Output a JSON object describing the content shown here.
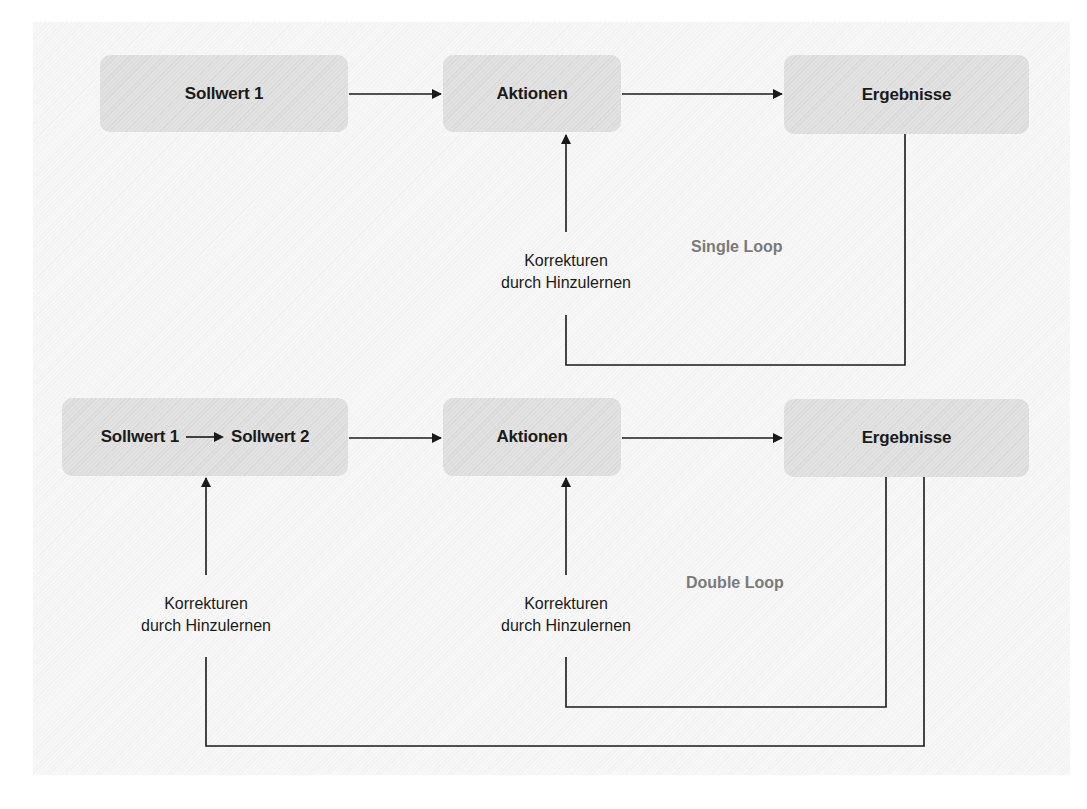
{
  "diagram": {
    "single_loop": {
      "title": "Single Loop",
      "nodes": {
        "setpoint": "Sollwert 1",
        "actions": "Aktionen",
        "results": "Ergebnisse"
      },
      "feedback_label": {
        "line1": "Korrekturen",
        "line2": "durch Hinzulernen"
      }
    },
    "double_loop": {
      "title": "Double Loop",
      "nodes": {
        "setpoint_from": "Sollwert 1",
        "setpoint_to": "Sollwert 2",
        "actions": "Aktionen",
        "results": "Ergebnisse"
      },
      "feedback_label_outer": {
        "line1": "Korrekturen",
        "line2": "durch Hinzulernen"
      },
      "feedback_label_inner": {
        "line1": "Korrekturen",
        "line2": "durch Hinzulernen"
      }
    },
    "colors": {
      "node_fill": "#e2e2e2",
      "line": "#1a1a1a",
      "loop_label": "#7a7a7a",
      "background": "#f7f7f7"
    }
  }
}
